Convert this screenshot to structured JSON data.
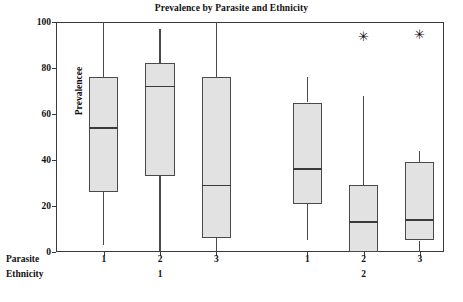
{
  "chart_data": {
    "type": "box",
    "title": "Prevalence by Parasite and Ethnicity",
    "ylabel": "Prevalencee",
    "xlabel": "",
    "ylim": [
      0,
      100
    ],
    "yticks": [
      0,
      20,
      40,
      60,
      80,
      100
    ],
    "grid": false,
    "legend": null,
    "group_axis_labels": [
      "Parasite",
      "Ethnicity"
    ],
    "boxes": [
      {
        "parasite": "1",
        "ethnicity": "1",
        "min": 3,
        "q1": 26,
        "median": 54,
        "q3": 76,
        "max": 100,
        "outliers": []
      },
      {
        "parasite": "2",
        "ethnicity": "1",
        "min": 0,
        "q1": 33,
        "median": 72,
        "q3": 82,
        "max": 97,
        "outliers": []
      },
      {
        "parasite": "3",
        "ethnicity": "1",
        "min": 0,
        "q1": 6,
        "median": 29,
        "q3": 76,
        "max": 100,
        "outliers": []
      },
      {
        "parasite": "1",
        "ethnicity": "2",
        "min": 5,
        "q1": 21,
        "median": 36,
        "q3": 65,
        "max": 76,
        "outliers": []
      },
      {
        "parasite": "2",
        "ethnicity": "2",
        "min": 0,
        "q1": 0,
        "median": 13,
        "q3": 29,
        "max": 68,
        "outliers": [
          94
        ]
      },
      {
        "parasite": "3",
        "ethnicity": "2",
        "min": 0,
        "q1": 5,
        "median": 14,
        "q3": 39,
        "max": 44,
        "outliers": [
          95
        ]
      }
    ],
    "ethnicity_groups": [
      {
        "label": "1",
        "boxes": [
          0,
          1,
          2
        ]
      },
      {
        "label": "2",
        "boxes": [
          3,
          4,
          5
        ]
      }
    ],
    "colors": {
      "box_fill": "#e2e2e2",
      "box_edge": "#4a4a4a",
      "median": "#3a3a3a",
      "whisker": "#4a4a4a",
      "frame": "#3a3a3a",
      "text": "#111111",
      "background": "#ffffff"
    }
  },
  "outlier_symbol": "✳"
}
